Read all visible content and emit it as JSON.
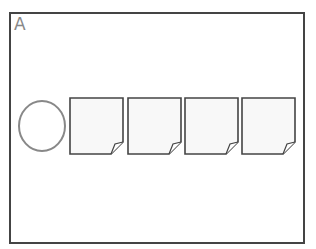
{
  "panel": {
    "label": "A",
    "frame_color": "#444444",
    "label_color": "#888888"
  },
  "shapes": {
    "circle": {
      "name": "circle",
      "stroke": "#888888"
    },
    "pages": [
      {
        "name": "page-1"
      },
      {
        "name": "page-2"
      },
      {
        "name": "page-3"
      },
      {
        "name": "page-4"
      }
    ],
    "page_fill": "#f8f8f8",
    "page_stroke": "#444444"
  }
}
